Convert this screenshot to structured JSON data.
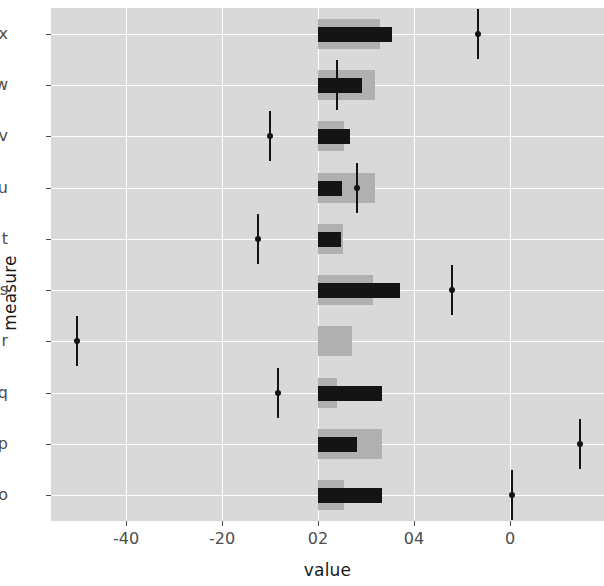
{
  "chart_data": {
    "type": "bar",
    "title": "",
    "subtitle": "",
    "xlabel": "value",
    "ylabel": "measure",
    "grid": true,
    "legend": "none",
    "orientation": "horizontal",
    "categories": [
      "x",
      "w",
      "v",
      "u",
      "t",
      "s",
      "r",
      "q",
      "p",
      "o"
    ],
    "x_tick_labels": [
      "-40",
      "-20",
      "02",
      "04",
      "0"
    ],
    "x_tick_positions": [
      -2,
      -1,
      0,
      1,
      2
    ],
    "xlim": [
      -2.78,
      3.0
    ],
    "annotations": [
      "x-axis tick labels are rendered as -40, -20, 02, 04, 0 at evenly spaced positions"
    ],
    "series": [
      {
        "name": "wide-light-bar",
        "color": "#b0b0b0",
        "values": [
          0.646,
          0.594,
          0.271,
          0.594,
          0.26,
          0.573,
          0.354,
          0.198,
          0.667,
          0.271
        ]
      },
      {
        "name": "narrow-dark-bar",
        "color": "#141414",
        "values": [
          0.771,
          0.458,
          0.333,
          0.25,
          0.24,
          0.854,
          0.0,
          0.667,
          0.406,
          0.667
        ]
      },
      {
        "name": "point-estimate",
        "color": "#141414",
        "values": [
          1.667,
          0.198,
          -0.5,
          0.406,
          -0.625,
          1.396,
          -2.51,
          -0.417,
          2.729,
          2.021
        ]
      }
    ],
    "rows": [
      {
        "label": "x",
        "wide_bar": 0.646,
        "dark_bar": 0.771,
        "point": 1.667,
        "err_low": 1.615,
        "err_high": 1.719
      },
      {
        "label": "w",
        "wide_bar": 0.594,
        "dark_bar": 0.458,
        "point": 0.198,
        "err_low": 0.146,
        "err_high": 0.25
      },
      {
        "label": "v",
        "wide_bar": 0.271,
        "dark_bar": 0.333,
        "point": -0.5,
        "err_low": -0.552,
        "err_high": -0.448
      },
      {
        "label": "u",
        "wide_bar": 0.594,
        "dark_bar": 0.25,
        "point": 0.406,
        "err_low": 0.354,
        "err_high": 0.458
      },
      {
        "label": "t",
        "wide_bar": 0.26,
        "dark_bar": 0.24,
        "point": -0.625,
        "err_low": -0.677,
        "err_high": -0.573
      },
      {
        "label": "s",
        "wide_bar": 0.573,
        "dark_bar": 0.854,
        "point": 1.396,
        "err_low": 1.344,
        "err_high": 1.448
      },
      {
        "label": "r",
        "wide_bar": 0.354,
        "dark_bar": 0.0,
        "point": -2.51,
        "err_low": -2.562,
        "err_high": -2.458
      },
      {
        "label": "q",
        "wide_bar": 0.198,
        "dark_bar": 0.667,
        "point": -0.417,
        "err_low": -0.469,
        "err_high": -0.365
      },
      {
        "label": "p",
        "wide_bar": 0.667,
        "dark_bar": 0.406,
        "point": 2.729,
        "err_low": 2.677,
        "err_high": 2.781
      },
      {
        "label": "o",
        "wide_bar": 0.271,
        "dark_bar": 0.667,
        "point": 2.021,
        "err_low": 1.969,
        "err_high": 2.073
      }
    ],
    "colors": {
      "panel_background": "#d9d9d9",
      "gridline": "#ffffff",
      "wide_bar": "#b0b0b0",
      "dark_bar": "#141414",
      "point": "#141414",
      "axis_text": "#4d4d4d",
      "title_text": "#1a1a1a",
      "figure_background": "#ffffff"
    }
  }
}
